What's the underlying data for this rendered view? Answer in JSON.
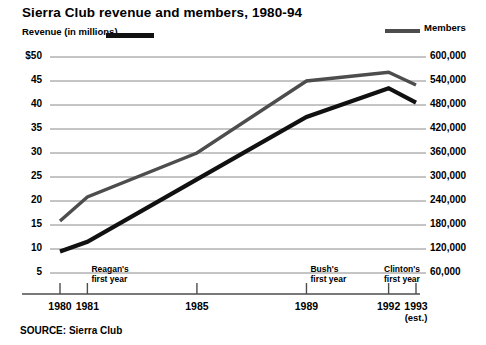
{
  "chart_data": {
    "type": "line",
    "title": "Sierra Club revenue and members, 1980-94",
    "xlabel": "",
    "ylabel": "Revenue (in millions)",
    "y2label": "Members",
    "grid": true,
    "legend_position": "top",
    "x": [
      1980,
      1981,
      1985,
      1989,
      1992,
      1993
    ],
    "xtick_labels": [
      "1980",
      "1981",
      "1985",
      "1989",
      "1992",
      "1993"
    ],
    "ylim": [
      5,
      50
    ],
    "ytick_labels": [
      "$50",
      "45",
      "40",
      "35",
      "30",
      "25",
      "20",
      "15",
      "10",
      "5"
    ],
    "ytick_values": [
      50,
      45,
      40,
      35,
      30,
      25,
      20,
      15,
      10,
      5
    ],
    "y2lim": [
      60000,
      600000
    ],
    "y2tick_labels": [
      "600,000",
      "540,000",
      "480,000",
      "420,000",
      "360,000",
      "300,000",
      "240,000",
      "180,000",
      "120,000",
      "60,000"
    ],
    "y2tick_values": [
      600000,
      540000,
      480000,
      420000,
      360000,
      300000,
      240000,
      180000,
      120000,
      60000
    ],
    "series": [
      {
        "name": "Revenue (in millions)",
        "axis": "left",
        "color": "#111111",
        "width": 4.2,
        "values": [
          9.5,
          11.5,
          24.5,
          37.5,
          43.5,
          40.5
        ]
      },
      {
        "name": "Members",
        "axis": "right",
        "color": "#4d4d4d",
        "width": 3.4,
        "values": [
          190000,
          250000,
          360000,
          540000,
          562000,
          530000
        ]
      }
    ],
    "annotations": [
      {
        "label_line1": "Reagan's",
        "label_line2": "first year",
        "at_x": 1981
      },
      {
        "label_line1": "Bush's",
        "label_line2": "first year",
        "at_x": 1989
      },
      {
        "label_line1": "Clinton's",
        "label_line2": "first year",
        "at_x": 1993
      }
    ]
  },
  "header": {
    "title": "Sierra Club revenue and members, 1980-94"
  },
  "legend": {
    "left_label": "Revenue (in millions)",
    "right_label": "Members"
  },
  "axes": {
    "left_ticks": [
      "$50",
      "45",
      "40",
      "35",
      "30",
      "25",
      "20",
      "15",
      "10",
      "5"
    ],
    "right_ticks": [
      "600,000",
      "540,000",
      "480,000",
      "420,000",
      "360,000",
      "300,000",
      "240,000",
      "180,000",
      "120,000",
      "60,000"
    ],
    "x_ticks": [
      {
        "label": "1980",
        "sub": ""
      },
      {
        "label": "1981",
        "sub": ""
      },
      {
        "label": "1985",
        "sub": ""
      },
      {
        "label": "1989",
        "sub": ""
      },
      {
        "label": "1992",
        "sub": ""
      },
      {
        "label": "1993",
        "sub": "(est.)"
      }
    ]
  },
  "annotations": [
    {
      "line1": "Reagan's",
      "line2": "first year"
    },
    {
      "line1": "Bush's",
      "line2": "first year"
    },
    {
      "line1": "Clinton's",
      "line2": "first year"
    }
  ],
  "footer": {
    "source": "SOURCE: Sierra Club"
  }
}
